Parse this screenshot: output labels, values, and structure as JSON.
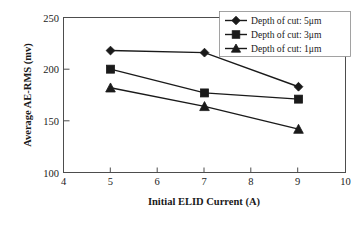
{
  "chart_data": {
    "type": "line",
    "title": "",
    "xlabel": "Initial ELID Current (A)",
    "ylabel": "Average AE-RMS (mv)",
    "xlim": [
      4,
      10
    ],
    "ylim": [
      100,
      250
    ],
    "xticks": [
      "4",
      "5",
      "6",
      "7",
      "8",
      "9",
      "10"
    ],
    "yticks": [
      "100",
      "150",
      "200",
      "250"
    ],
    "x": [
      5,
      7,
      9
    ],
    "grid": false,
    "legend_position": "top-right",
    "series": [
      {
        "name": "Depth of cut: 5μm",
        "marker": "diamond",
        "color": "#1a1a1a",
        "values": [
          218,
          216,
          183
        ]
      },
      {
        "name": "Depth of cut: 3μm",
        "marker": "square",
        "color": "#1a1a1a",
        "values": [
          200,
          177,
          171
        ]
      },
      {
        "name": "Depth of cut: 1μm",
        "marker": "triangle",
        "color": "#1a1a1a",
        "values": [
          182,
          164,
          142
        ]
      }
    ]
  },
  "axes": {
    "x_title": "Initial ELID Current (A)",
    "y_title": "Average AE-RMS (mv)",
    "x_tick_labels": [
      "4",
      "5",
      "6",
      "7",
      "8",
      "9",
      "10"
    ],
    "y_tick_labels": [
      "100",
      "150",
      "200",
      "250"
    ]
  },
  "legend": {
    "entries": [
      {
        "label": "Depth of cut: 5μm",
        "marker": "diamond-marker"
      },
      {
        "label": "Depth of cut: 3μm",
        "marker": "square-marker"
      },
      {
        "label": "Depth of cut: 1μm",
        "marker": "triangle-marker"
      }
    ]
  }
}
